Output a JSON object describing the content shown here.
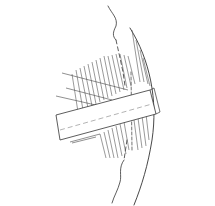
{
  "figure": {
    "type": "line-drawing",
    "colors": {
      "background": "#ffffff",
      "ink": "#333333",
      "hatch": "#555555"
    },
    "elements": [
      "outer-arc",
      "wavy-dashed-boundary",
      "hatched-region",
      "diagonal-bar",
      "bar-centerline",
      "vertical-dashed-line"
    ]
  }
}
